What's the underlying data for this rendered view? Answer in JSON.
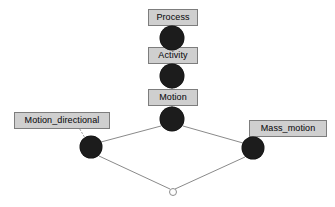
{
  "diagram": {
    "background_color": "#ffffff",
    "node_color": "#1c1c1c",
    "edge_color": "#8a8a8a",
    "box_fill_color": "#cfcfcf",
    "box_border_color": "#7d7d7d",
    "text_color": "#16161a"
  },
  "nodes": [
    {
      "id": "process",
      "label": "Process",
      "x": 172,
      "y": 38,
      "r": 12,
      "type": "filled"
    },
    {
      "id": "activity",
      "label": "Activity",
      "x": 172,
      "y": 76,
      "r": 12,
      "type": "filled"
    },
    {
      "id": "motion",
      "label": "Motion",
      "x": 172,
      "y": 119,
      "r": 12,
      "type": "filled"
    },
    {
      "id": "motion_directional",
      "label": "Motion_directional",
      "x": 91,
      "y": 147,
      "r": 11,
      "type": "filled"
    },
    {
      "id": "mass_motion",
      "label": "Mass_motion",
      "x": 253,
      "y": 148,
      "r": 11,
      "type": "filled"
    },
    {
      "id": "junction",
      "label": "",
      "x": 172,
      "y": 191,
      "r": 3,
      "type": "hollow"
    }
  ],
  "labels": [
    {
      "for": "process",
      "text": "Process",
      "left": 148,
      "top": 9,
      "width": 50
    },
    {
      "for": "activity",
      "text": "Activity",
      "left": 148,
      "top": 47,
      "width": 50
    },
    {
      "for": "motion",
      "text": "Motion",
      "left": 148,
      "top": 89,
      "width": 50
    },
    {
      "for": "motion_directional",
      "text": "Motion_directional",
      "left": 14,
      "top": 112,
      "width": 96
    },
    {
      "for": "mass_motion",
      "text": "Mass_motion",
      "left": 249,
      "top": 120,
      "width": 78
    }
  ],
  "edges": [
    {
      "from": "process",
      "to": "activity",
      "x1": 172,
      "y1": 50,
      "x2": 172,
      "y2": 66
    },
    {
      "from": "activity",
      "to": "motion",
      "x1": 172,
      "y1": 88,
      "x2": 172,
      "y2": 108
    },
    {
      "from": "motion",
      "to": "motion_directional",
      "x1": 161,
      "y1": 126,
      "x2": 101,
      "y2": 142
    },
    {
      "from": "motion",
      "to": "mass_motion",
      "x1": 183,
      "y1": 126,
      "x2": 243,
      "y2": 143
    },
    {
      "from": "motion_directional",
      "to": "junction",
      "x1": 99,
      "y1": 156,
      "x2": 170,
      "y2": 189
    },
    {
      "from": "mass_motion",
      "to": "junction",
      "x1": 245,
      "y1": 157,
      "x2": 175,
      "y2": 189
    }
  ],
  "connectors": [
    {
      "for": "motion_directional",
      "x1": 78,
      "y1": 126,
      "x2": 85,
      "y2": 138
    },
    {
      "for": "mass_motion",
      "x1": 262,
      "y1": 133,
      "x2": 256,
      "y2": 142
    }
  ]
}
